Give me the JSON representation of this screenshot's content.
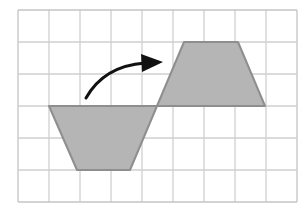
{
  "diagram": {
    "colors": {
      "background": "#ffffff",
      "grid_line": "#cfcfcf",
      "grid_border": "#c4c4c4",
      "shape_fill": "#b5b5b5",
      "shape_stroke": "#8e8e8e",
      "arrow": "#111111"
    },
    "grid": {
      "x0": 18,
      "y0": 10,
      "columns": 9,
      "rows": 6,
      "cell_width": 31,
      "cell_height": 32
    },
    "shapes": [
      {
        "name": "original-trapezoid",
        "points": [
          [
            49,
            106
          ],
          [
            157,
            106
          ],
          [
            130,
            170
          ],
          [
            77,
            170
          ]
        ]
      },
      {
        "name": "rotated-trapezoid",
        "points": [
          [
            157,
            106
          ],
          [
            265,
            106
          ],
          [
            238,
            42
          ],
          [
            184,
            42
          ]
        ]
      }
    ],
    "arrow": {
      "path": "M86,98 Q104,66 145,63",
      "head": [
        [
          141,
          54
        ],
        [
          163,
          62
        ],
        [
          142,
          72
        ]
      ]
    }
  }
}
